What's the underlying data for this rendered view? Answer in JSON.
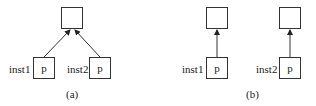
{
  "diagrams": {
    "a": {
      "caption": "(a)",
      "top_box": "",
      "inst1": {
        "label": "inst1",
        "box": "p"
      },
      "inst2": {
        "label": "inst2",
        "box": "p"
      }
    },
    "b": {
      "caption": "(b)",
      "left": {
        "top_box": "",
        "label": "inst1",
        "box": "p"
      },
      "right": {
        "top_box": "",
        "label": "inst2",
        "box": "p"
      }
    }
  },
  "colors": {
    "stroke": "#333333",
    "background": "#ffffff"
  }
}
